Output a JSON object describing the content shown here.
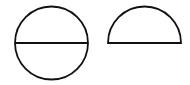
{
  "diagram": {
    "background": "#ffffff",
    "stroke_color": "#111111",
    "stroke_width": 1.8,
    "shapes": [
      {
        "type": "circle-with-diameter",
        "cx": 51.5,
        "cy": 43,
        "r": 36.5,
        "diameter": {
          "x1": 15,
          "y1": 43,
          "x2": 88,
          "y2": 43
        }
      },
      {
        "type": "semicircle",
        "cx": 144.5,
        "cy": 43,
        "r": 36.5,
        "base": {
          "x1": 108,
          "y1": 43,
          "x2": 181,
          "y2": 43
        }
      }
    ]
  }
}
